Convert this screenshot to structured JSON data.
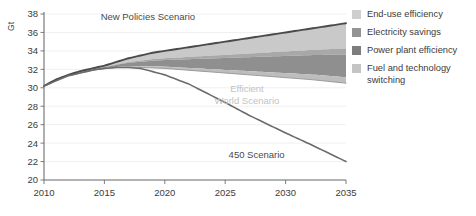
{
  "chart_data": {
    "type": "area",
    "title": "",
    "xlabel": "",
    "ylabel": "Gt",
    "xlim": [
      2010,
      2035
    ],
    "ylim": [
      20,
      38
    ],
    "ytick_step": 2,
    "grid": true,
    "x": [
      2010,
      2015,
      2020,
      2025,
      2030,
      2035
    ],
    "xticks": [
      "2010",
      "2015",
      "2020",
      "2025",
      "2030",
      "2035"
    ],
    "yticks": [
      "20",
      "22",
      "24",
      "26",
      "28",
      "30",
      "32",
      "34",
      "36",
      "38"
    ],
    "series": [
      {
        "name": "New Policies Scenario",
        "type": "line",
        "color": "#4a4a4a",
        "x": [
          2010,
          2011,
          2012,
          2013,
          2014,
          2015,
          2016,
          2017,
          2018,
          2019,
          2020,
          2022,
          2025,
          2027,
          2030,
          2032,
          2035
        ],
        "values": [
          30.2,
          30.9,
          31.4,
          31.8,
          32.1,
          32.4,
          32.8,
          33.2,
          33.5,
          33.8,
          34.0,
          34.4,
          35.0,
          35.4,
          36.0,
          36.4,
          37.0
        ]
      },
      {
        "name": "450 Scenario",
        "type": "line",
        "color": "#6b6b6b",
        "x": [
          2010,
          2012,
          2014,
          2015,
          2016,
          2017,
          2018,
          2020,
          2022,
          2025,
          2027,
          2030,
          2032,
          2035
        ],
        "values": [
          30.2,
          31.3,
          31.9,
          32.1,
          32.2,
          32.2,
          32.1,
          31.4,
          30.4,
          28.4,
          27.0,
          25.1,
          23.9,
          22.0
        ]
      },
      {
        "name": "Efficient World Scenario",
        "type": "line",
        "color": "#9a9a9a",
        "x": [
          2010,
          2012,
          2014,
          2015,
          2016,
          2017,
          2018,
          2020,
          2022,
          2025,
          2027,
          2030,
          2032,
          2035
        ],
        "values": [
          30.2,
          31.3,
          31.9,
          32.1,
          32.2,
          32.25,
          32.2,
          32.1,
          31.9,
          31.6,
          31.4,
          31.1,
          30.9,
          30.5
        ]
      }
    ],
    "bands": [
      {
        "name": "End-use efficiency",
        "color": "#c9c9c9",
        "note": "topmost wedge, directly under New Policies Scenario line"
      },
      {
        "name": "Electricity savings",
        "color": "#a8a8a8",
        "note": "thin wedge below end-use efficiency"
      },
      {
        "name": "Power plant efficiency",
        "color": "#8f8f8f",
        "note": "darkest wedge, lower middle of the gap"
      },
      {
        "name": "Fuel and technology switching",
        "color": "#bdbdbd",
        "note": "thin bottom wedge reaching the Efficient World Scenario line"
      }
    ],
    "annotations": [
      {
        "text": "New Policies Scenario",
        "x": 2018.6,
        "y": 37.3,
        "style": "dark"
      },
      {
        "text": "Efficient\nWorld Scenario",
        "x": 2026.8,
        "y": 29.5,
        "style": "light"
      },
      {
        "text": "450 Scenario",
        "x": 2027.6,
        "y": 22.4,
        "style": "dark"
      }
    ]
  },
  "legend": {
    "position": "right",
    "items": [
      {
        "label": "End-use efficiency",
        "color": "#cfcfcf"
      },
      {
        "label": "Electricity savings",
        "color": "#949494"
      },
      {
        "label": "Power plant efficiency",
        "color": "#7d7d7d"
      },
      {
        "label": "Fuel and technology\nswitching",
        "color": "#c4c4c4"
      }
    ]
  },
  "axis": {
    "y_unit_label": "Gt",
    "axis_color": "#6e6e6e",
    "grid_color": "#f0f0f0"
  }
}
